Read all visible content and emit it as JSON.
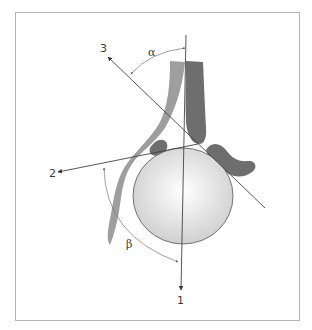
{
  "figure": {
    "labels": {
      "axis1": "1",
      "axis2": "2",
      "axis3": "3",
      "alpha": "α",
      "beta": "β"
    },
    "colors": {
      "frame": "#b4b4b4",
      "line": "#444444",
      "dark_shape": "#6b6b6b",
      "light_shape": "#9a9a9a",
      "circle_fill_center": "#ffffff",
      "circle_fill_edge": "#cfcfcf",
      "circle_stroke": "#555555"
    }
  }
}
